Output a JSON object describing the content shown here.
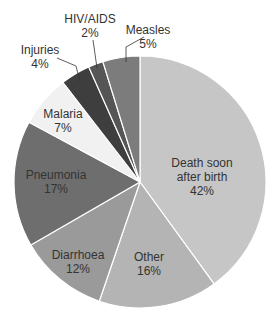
{
  "chart_data": {
    "type": "pie",
    "title": "",
    "center": [
      140,
      182
    ],
    "radius": 126,
    "slices": [
      {
        "name": "Death soon after birth",
        "label_lines": [
          "Death soon",
          "after birth"
        ],
        "value": 42,
        "pct": "42%",
        "color": "#c6c6c6",
        "label_pos": [
          202,
          156
        ],
        "inside": true
      },
      {
        "name": "Other",
        "label_lines": [
          "Other"
        ],
        "value": 16,
        "pct": "16%",
        "color": "#b4b4b4",
        "label_pos": [
          149,
          250
        ],
        "inside": true
      },
      {
        "name": "Diarrhoea",
        "label_lines": [
          "Diarrhoea"
        ],
        "value": 12,
        "pct": "12%",
        "color": "#9a9a9a",
        "label_pos": [
          78,
          248
        ],
        "inside": true
      },
      {
        "name": "Pneumonia",
        "label_lines": [
          "Pneumonia"
        ],
        "value": 17,
        "pct": "17%",
        "color": "#6e6e6e",
        "label_pos": [
          56,
          168
        ],
        "inside": true
      },
      {
        "name": "Malaria",
        "label_lines": [
          "Malaria"
        ],
        "value": 7,
        "pct": "7%",
        "color": "#f1f1f1",
        "label_pos": [
          63,
          107
        ],
        "inside": true
      },
      {
        "name": "Injuries",
        "label_lines": [
          "Injuries"
        ],
        "value": 4,
        "pct": "4%",
        "color": "#3e3e3e",
        "label_pos": [
          40,
          43
        ],
        "inside": false
      },
      {
        "name": "HIV/AIDS",
        "label_lines": [
          "HIV/AIDS"
        ],
        "value": 2,
        "pct": "2%",
        "color": "#555555",
        "label_pos": [
          90,
          12
        ],
        "inside": false
      },
      {
        "name": "Measles",
        "label_lines": [
          "Measles"
        ],
        "value": 5,
        "pct": "5%",
        "color": "#7c7c7c",
        "label_pos": [
          148,
          23
        ],
        "inside": false
      }
    ],
    "leaders": [
      {
        "name": "Injuries",
        "points": [
          [
            57,
            58
          ],
          [
            76,
            66
          ],
          [
            80,
            82
          ]
        ]
      },
      {
        "name": "HIV/AIDS",
        "points": [
          [
            93,
            40
          ],
          [
            97,
            68
          ]
        ]
      },
      {
        "name": "Measles",
        "points": [
          [
            144,
            37
          ],
          [
            126,
            47
          ],
          [
            126,
            62
          ]
        ]
      }
    ],
    "legend": "none",
    "grid": false
  }
}
